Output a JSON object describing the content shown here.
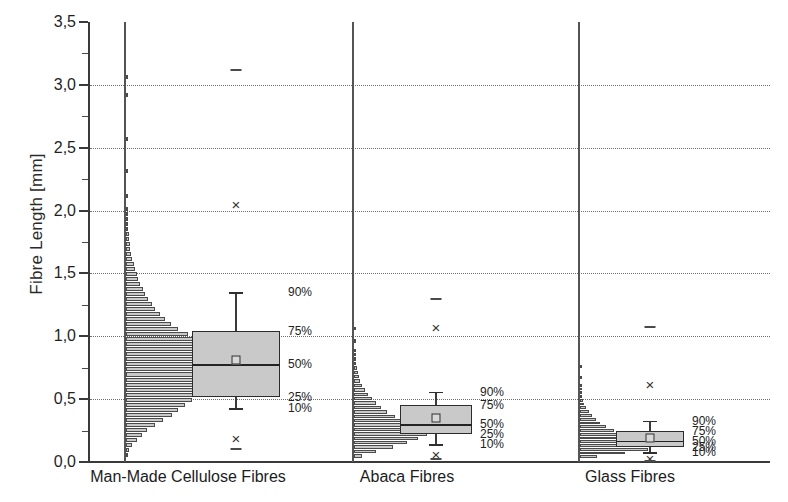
{
  "chart_data": {
    "type": "box",
    "title": "",
    "xlabel": "",
    "ylabel": "Fibre Length [mm]",
    "ylim": [
      0.0,
      3.5
    ],
    "ytick_step": 0.5,
    "ytick_labels": [
      "0,0",
      "0,5",
      "1,0",
      "1,5",
      "2,0",
      "2,5",
      "3,0",
      "3,5"
    ],
    "ytick_values": [
      0.0,
      0.5,
      1.0,
      1.5,
      2.0,
      2.5,
      3.0,
      3.5
    ],
    "grid": "horizontal-dotted",
    "legend": "none",
    "decimal_separator": ",",
    "percentile_labels": [
      "90%",
      "75%",
      "50%",
      "25%",
      "10%"
    ],
    "categories": [
      "Man-Made Cellulose Fibres",
      "Abaca Fibres",
      "Glass Fibres"
    ],
    "series": [
      {
        "name": "Man-Made Cellulose Fibres",
        "p10": 0.43,
        "p25": 0.52,
        "median": 0.78,
        "p75": 1.04,
        "p90": 1.35,
        "mean": 0.81,
        "outlier_low": 0.19,
        "outlier_high": 2.05,
        "extreme_low": 0.1,
        "extreme_high": 3.12,
        "histogram": {
          "bin_width": 0.04,
          "bins": [
            {
              "y": 0.04,
              "count": 2
            },
            {
              "y": 0.08,
              "count": 3
            },
            {
              "y": 0.12,
              "count": 6
            },
            {
              "y": 0.16,
              "count": 10
            },
            {
              "y": 0.2,
              "count": 14
            },
            {
              "y": 0.24,
              "count": 19
            },
            {
              "y": 0.28,
              "count": 26
            },
            {
              "y": 0.32,
              "count": 33
            },
            {
              "y": 0.36,
              "count": 41
            },
            {
              "y": 0.4,
              "count": 46
            },
            {
              "y": 0.44,
              "count": 52
            },
            {
              "y": 0.48,
              "count": 58
            },
            {
              "y": 0.52,
              "count": 62
            },
            {
              "y": 0.56,
              "count": 66
            },
            {
              "y": 0.6,
              "count": 70
            },
            {
              "y": 0.64,
              "count": 74
            },
            {
              "y": 0.68,
              "count": 78
            },
            {
              "y": 0.72,
              "count": 82
            },
            {
              "y": 0.76,
              "count": 88
            },
            {
              "y": 0.8,
              "count": 80
            },
            {
              "y": 0.84,
              "count": 75
            },
            {
              "y": 0.88,
              "count": 70
            },
            {
              "y": 0.92,
              "count": 84
            },
            {
              "y": 0.96,
              "count": 64
            },
            {
              "y": 1.0,
              "count": 55
            },
            {
              "y": 1.04,
              "count": 46
            },
            {
              "y": 1.08,
              "count": 40
            },
            {
              "y": 1.12,
              "count": 35
            },
            {
              "y": 1.16,
              "count": 30
            },
            {
              "y": 1.2,
              "count": 26
            },
            {
              "y": 1.24,
              "count": 23
            },
            {
              "y": 1.28,
              "count": 20
            },
            {
              "y": 1.32,
              "count": 17
            },
            {
              "y": 1.36,
              "count": 15
            },
            {
              "y": 1.4,
              "count": 13
            },
            {
              "y": 1.44,
              "count": 11
            },
            {
              "y": 1.48,
              "count": 10
            },
            {
              "y": 1.52,
              "count": 8
            },
            {
              "y": 1.56,
              "count": 7
            },
            {
              "y": 1.6,
              "count": 6
            },
            {
              "y": 1.64,
              "count": 5
            },
            {
              "y": 1.68,
              "count": 4
            },
            {
              "y": 1.72,
              "count": 4
            },
            {
              "y": 1.76,
              "count": 3
            },
            {
              "y": 1.8,
              "count": 3
            },
            {
              "y": 1.84,
              "count": 2
            },
            {
              "y": 1.88,
              "count": 2
            },
            {
              "y": 1.92,
              "count": 2
            },
            {
              "y": 1.96,
              "count": 1
            },
            {
              "y": 2.0,
              "count": 1
            },
            {
              "y": 2.1,
              "count": 1
            },
            {
              "y": 2.3,
              "count": 1
            },
            {
              "y": 2.55,
              "count": 1
            },
            {
              "y": 2.9,
              "count": 1
            },
            {
              "y": 3.05,
              "count": 1
            }
          ]
        }
      },
      {
        "name": "Abaca Fibres",
        "p10": 0.14,
        "p25": 0.22,
        "median": 0.3,
        "p75": 0.45,
        "p90": 0.56,
        "mean": 0.35,
        "outlier_low": 0.06,
        "outlier_high": 1.07,
        "extreme_low": 0.02,
        "extreme_high": 1.3,
        "histogram": {
          "bin_width": 0.035,
          "bins": [
            {
              "y": 0.035,
              "count": 8
            },
            {
              "y": 0.07,
              "count": 22
            },
            {
              "y": 0.105,
              "count": 38
            },
            {
              "y": 0.14,
              "count": 52
            },
            {
              "y": 0.175,
              "count": 63
            },
            {
              "y": 0.21,
              "count": 72
            },
            {
              "y": 0.245,
              "count": 80
            },
            {
              "y": 0.28,
              "count": 64
            },
            {
              "y": 0.315,
              "count": 50
            },
            {
              "y": 0.35,
              "count": 40
            },
            {
              "y": 0.385,
              "count": 33
            },
            {
              "y": 0.42,
              "count": 27
            },
            {
              "y": 0.455,
              "count": 22
            },
            {
              "y": 0.49,
              "count": 18
            },
            {
              "y": 0.525,
              "count": 14
            },
            {
              "y": 0.56,
              "count": 11
            },
            {
              "y": 0.595,
              "count": 8
            },
            {
              "y": 0.63,
              "count": 6
            },
            {
              "y": 0.665,
              "count": 5
            },
            {
              "y": 0.7,
              "count": 4
            },
            {
              "y": 0.735,
              "count": 3
            },
            {
              "y": 0.77,
              "count": 2
            },
            {
              "y": 0.805,
              "count": 2
            },
            {
              "y": 0.84,
              "count": 1
            },
            {
              "y": 0.875,
              "count": 1
            },
            {
              "y": 0.95,
              "count": 1
            },
            {
              "y": 1.05,
              "count": 1
            }
          ]
        }
      },
      {
        "name": "Glass Fibres",
        "p10": 0.08,
        "p25": 0.12,
        "median": 0.17,
        "p75": 0.25,
        "p90": 0.33,
        "mean": 0.19,
        "outlier_low": 0.03,
        "outlier_high": 0.62,
        "extreme_low": 0.01,
        "extreme_high": 1.07,
        "histogram": {
          "bin_width": 0.03,
          "bins": [
            {
              "y": 0.03,
              "count": 18
            },
            {
              "y": 0.06,
              "count": 48
            },
            {
              "y": 0.09,
              "count": 72
            },
            {
              "y": 0.12,
              "count": 80
            },
            {
              "y": 0.15,
              "count": 66
            },
            {
              "y": 0.18,
              "count": 56
            },
            {
              "y": 0.21,
              "count": 45
            },
            {
              "y": 0.24,
              "count": 36
            },
            {
              "y": 0.27,
              "count": 28
            },
            {
              "y": 0.3,
              "count": 22
            },
            {
              "y": 0.33,
              "count": 17
            },
            {
              "y": 0.36,
              "count": 13
            },
            {
              "y": 0.39,
              "count": 10
            },
            {
              "y": 0.42,
              "count": 7
            },
            {
              "y": 0.45,
              "count": 5
            },
            {
              "y": 0.48,
              "count": 4
            },
            {
              "y": 0.51,
              "count": 3
            },
            {
              "y": 0.54,
              "count": 2
            },
            {
              "y": 0.57,
              "count": 2
            },
            {
              "y": 0.6,
              "count": 1
            },
            {
              "y": 0.66,
              "count": 1
            },
            {
              "y": 0.75,
              "count": 1
            }
          ]
        }
      }
    ]
  },
  "axis": {
    "y_title": "Fibre Length [mm]"
  },
  "markers": {
    "outlier_glyph": "×",
    "mean_glyph": "square"
  }
}
